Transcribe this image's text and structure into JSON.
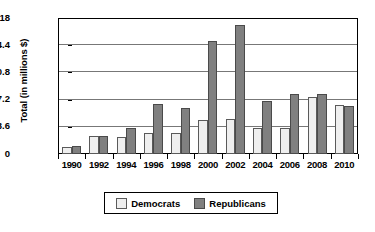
{
  "chart_data": {
    "type": "bar",
    "title": "",
    "xlabel": "",
    "ylabel": "Total (in millions $)",
    "categories": [
      "1990",
      "1992",
      "1994",
      "1996",
      "1998",
      "2000",
      "2002",
      "2004",
      "2006",
      "2008",
      "2010"
    ],
    "series": [
      {
        "name": "Democrats",
        "color": "#efefef",
        "values": [
          0.9,
          2.4,
          2.2,
          2.8,
          2.8,
          4.5,
          4.6,
          3.4,
          3.4,
          7.5,
          6.5
        ]
      },
      {
        "name": "Republicans",
        "color": "#808080",
        "values": [
          1.1,
          2.4,
          3.5,
          6.6,
          6.1,
          15.0,
          17.1,
          7.0,
          7.9,
          8.0,
          6.3
        ]
      }
    ],
    "ylim": [
      0,
      18
    ],
    "yticks": [
      "0",
      "3.6",
      "7.2",
      "10.8",
      "14.4",
      "18"
    ],
    "ytick_values": [
      0,
      3.6,
      7.2,
      10.8,
      14.4,
      18
    ],
    "grid": true,
    "legend_position": "bottom"
  },
  "legend": {
    "items": [
      {
        "label": "Democrats"
      },
      {
        "label": "Republicans"
      }
    ]
  }
}
